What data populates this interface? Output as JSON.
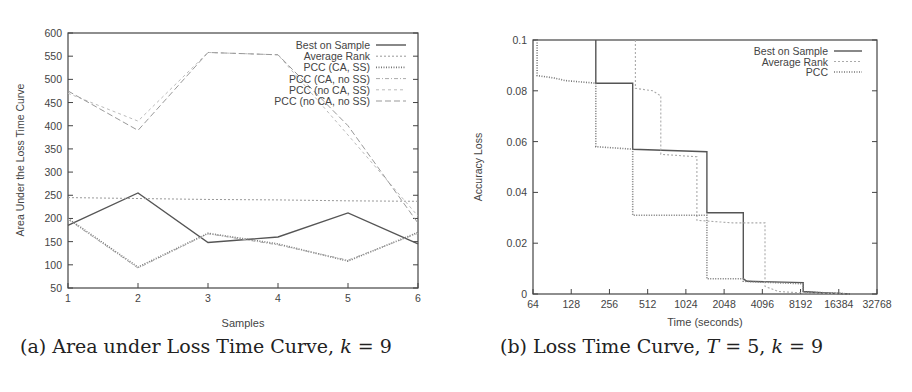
{
  "chart_data": [
    {
      "type": "line",
      "panel": "a",
      "caption_prefix": "(a) Area under Loss Time Curve, ",
      "caption_var": "k",
      "caption_suffix": " = 9",
      "xlabel": "Samples",
      "ylabel": "Area Under the Loss Time Curve",
      "x": [
        1,
        2,
        3,
        4,
        5,
        6
      ],
      "xticks": [
        "1",
        "2",
        "3",
        "4",
        "5",
        "6"
      ],
      "yticks": [
        "50",
        "100",
        "150",
        "200",
        "250",
        "300",
        "350",
        "400",
        "450",
        "500",
        "550",
        "600"
      ],
      "ylim": [
        50,
        600
      ],
      "xlim": [
        1,
        6
      ],
      "legend_position": "top-right",
      "grid": false,
      "series": [
        {
          "name": "Best on Sample",
          "values": [
            185,
            255,
            148,
            160,
            212,
            145
          ],
          "color": "#555555",
          "dash": "",
          "width": 1.4
        },
        {
          "name": "Average Rank",
          "values": [
            245,
            243,
            241,
            240,
            238,
            237
          ],
          "color": "#999999",
          "dash": "2,2",
          "width": 1
        },
        {
          "name": "PCC (CA, SS)",
          "values": [
            200,
            95,
            168,
            145,
            108,
            170
          ],
          "color": "#777777",
          "dash": "1,1.5",
          "width": 1.6
        },
        {
          "name": "PCC (CA, no SS)",
          "values": [
            198,
            93,
            167,
            143,
            110,
            168
          ],
          "color": "#aaaaaa",
          "dash": "4,2,1,2",
          "width": 1
        },
        {
          "name": "PCC (no CA, SS)",
          "values": [
            470,
            410,
            558,
            553,
            380,
            205
          ],
          "color": "#bbbbbb",
          "dash": "3,3",
          "width": 1
        },
        {
          "name": "PCC (no CA, no SS)",
          "values": [
            475,
            390,
            558,
            553,
            400,
            190
          ],
          "color": "#999999",
          "dash": "6,3",
          "width": 1
        }
      ]
    },
    {
      "type": "line",
      "panel": "b",
      "caption_prefix": "(b) Loss Time Curve, ",
      "caption_var": "T",
      "caption_mid": " = 5, ",
      "caption_var2": "k",
      "caption_suffix": " = 9",
      "xlabel": "Time (seconds)",
      "ylabel": "Accuracy Loss",
      "xscale": "log2",
      "xticks": [
        "64",
        "128",
        "256",
        "512",
        "1024",
        "2048",
        "4096",
        "8192",
        "16384",
        "32768"
      ],
      "yticks": [
        "0",
        "0.02",
        "0.04",
        "0.06",
        "0.08",
        "0.1"
      ],
      "xlim": [
        64,
        32768
      ],
      "ylim": [
        0,
        0.1
      ],
      "legend_position": "top-right",
      "grid": false,
      "series": [
        {
          "name": "Best on Sample",
          "color": "#555555",
          "dash": "",
          "width": 1.4,
          "points": [
            [
              200,
              0.1
            ],
            [
              200,
              0.083
            ],
            [
              390,
              0.083
            ],
            [
              390,
              0.057
            ],
            [
              1500,
              0.056
            ],
            [
              1500,
              0.032
            ],
            [
              2900,
              0.032
            ],
            [
              2900,
              0.006
            ],
            [
              3100,
              0.005
            ],
            [
              8600,
              0.0045
            ],
            [
              8600,
              0.001
            ],
            [
              12000,
              0.0005
            ],
            [
              20000,
              0.0
            ]
          ]
        },
        {
          "name": "Average Rank",
          "color": "#aaaaaa",
          "dash": "2,2",
          "width": 1.1,
          "points": [
            [
              410,
              0.1
            ],
            [
              410,
              0.081
            ],
            [
              560,
              0.08
            ],
            [
              650,
              0.078
            ],
            [
              650,
              0.055
            ],
            [
              1250,
              0.054
            ],
            [
              1250,
              0.029
            ],
            [
              2400,
              0.028
            ],
            [
              4300,
              0.028
            ],
            [
              4300,
              0.003
            ],
            [
              5500,
              0.001
            ],
            [
              8000,
              0.0005
            ],
            [
              20000,
              0.0
            ]
          ]
        },
        {
          "name": "PCC",
          "color": "#777777",
          "dash": "1,1.5",
          "width": 1.6,
          "points": [
            [
              69,
              0.1
            ],
            [
              69,
              0.086
            ],
            [
              95,
              0.085
            ],
            [
              115,
              0.084
            ],
            [
              200,
              0.083
            ],
            [
              200,
              0.058
            ],
            [
              390,
              0.057
            ],
            [
              390,
              0.031
            ],
            [
              1500,
              0.031
            ],
            [
              1500,
              0.006
            ],
            [
              2900,
              0.006
            ],
            [
              2900,
              0.005
            ],
            [
              8600,
              0.004
            ],
            [
              8600,
              0.0008
            ],
            [
              16000,
              0.0003
            ],
            [
              20000,
              0.0
            ]
          ]
        }
      ]
    }
  ]
}
